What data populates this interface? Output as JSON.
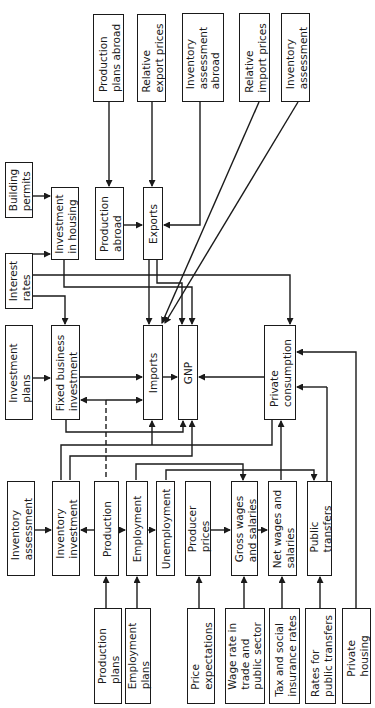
{
  "diagram": {
    "orientation": "rotated-90-ccw",
    "nodes": [
      {
        "id": "production_plans_abroad",
        "label": "Production\nplans abroad",
        "x": 93,
        "y": 14,
        "w": 31,
        "h": 88
      },
      {
        "id": "relative_export_prices",
        "label": "Relative\nexport prices",
        "x": 137,
        "y": 14,
        "w": 29,
        "h": 88
      },
      {
        "id": "inventory_assessment_abroad",
        "label": "Inventory\nassessment\nabroad",
        "x": 182,
        "y": 13,
        "w": 42,
        "h": 89
      },
      {
        "id": "relative_import_prices",
        "label": "Relative\nimport prices",
        "x": 239,
        "y": 13,
        "w": 31,
        "h": 89
      },
      {
        "id": "inventory_assessment_top",
        "label": "Inventory\nassessment",
        "x": 281,
        "y": 13,
        "w": 29,
        "h": 89
      },
      {
        "id": "building_permits",
        "label": "Building\npermits",
        "x": 5,
        "y": 162,
        "w": 28,
        "h": 56
      },
      {
        "id": "investment_in_housing",
        "label": "Investment\nin housing",
        "x": 51,
        "y": 187,
        "w": 28,
        "h": 73
      },
      {
        "id": "production_abroad",
        "label": "Production\nabroad",
        "x": 95,
        "y": 187,
        "w": 29,
        "h": 73
      },
      {
        "id": "exports",
        "label": "Exports",
        "x": 143,
        "y": 187,
        "w": 20,
        "h": 73
      },
      {
        "id": "interest_rates",
        "label": "Interest\nrates",
        "x": 5,
        "y": 253,
        "w": 28,
        "h": 56
      },
      {
        "id": "investment_plans",
        "label": "Investment\nplans",
        "x": 5,
        "y": 325,
        "w": 28,
        "h": 95
      },
      {
        "id": "fixed_business_investment",
        "label": "Fixed business\ninvestment",
        "x": 51,
        "y": 325,
        "w": 29,
        "h": 95
      },
      {
        "id": "imports",
        "label": "Imports",
        "x": 143,
        "y": 325,
        "w": 20,
        "h": 95
      },
      {
        "id": "gnp",
        "label": "GNP",
        "x": 178,
        "y": 325,
        "w": 20,
        "h": 95
      },
      {
        "id": "private_consumption",
        "label": "Private\nconsumption",
        "x": 264,
        "y": 325,
        "w": 32,
        "h": 95
      },
      {
        "id": "inventory_assessment",
        "label": "Inventory\nassessment",
        "x": 7,
        "y": 481,
        "w": 28,
        "h": 95
      },
      {
        "id": "inventory_investment",
        "label": "Inventory\ninvestment",
        "x": 52,
        "y": 481,
        "w": 28,
        "h": 95
      },
      {
        "id": "production",
        "label": "Production",
        "x": 94,
        "y": 481,
        "w": 25,
        "h": 95
      },
      {
        "id": "employment",
        "label": "Employment",
        "x": 126,
        "y": 481,
        "w": 22,
        "h": 95
      },
      {
        "id": "unemployment",
        "label": "Unemployment",
        "x": 156,
        "y": 481,
        "w": 19,
        "h": 95
      },
      {
        "id": "producer_prices",
        "label": "Producer\nprices",
        "x": 185,
        "y": 481,
        "w": 26,
        "h": 95
      },
      {
        "id": "gross_wages",
        "label": "Gross wages\nand salaries",
        "x": 231,
        "y": 481,
        "w": 27,
        "h": 95
      },
      {
        "id": "net_wages",
        "label": "Net wages and\nsalaries",
        "x": 268,
        "y": 481,
        "w": 29,
        "h": 95
      },
      {
        "id": "public_transfers",
        "label": "Public\ntransfers",
        "x": 307,
        "y": 481,
        "w": 25,
        "h": 95
      },
      {
        "id": "production_plans",
        "label": "Production\nplans",
        "x": 94,
        "y": 608,
        "w": 28,
        "h": 96
      },
      {
        "id": "employment_plans",
        "label": "Employment\nplans",
        "x": 125,
        "y": 608,
        "w": 26,
        "h": 96
      },
      {
        "id": "price_expectations",
        "label": "Price\nexpectations",
        "x": 187,
        "y": 608,
        "w": 28,
        "h": 96
      },
      {
        "id": "wage_rate",
        "label": "Wage rate in\ntrade and\npublic sector",
        "x": 225,
        "y": 608,
        "w": 40,
        "h": 96
      },
      {
        "id": "tax_social",
        "label": "Tax and social\ninsurance rates",
        "x": 269,
        "y": 608,
        "w": 31,
        "h": 96
      },
      {
        "id": "rates_public_transfers",
        "label": "Rates for\npublic transfers",
        "x": 305,
        "y": 608,
        "w": 31,
        "h": 96
      },
      {
        "id": "private_housing",
        "label": "Private\nhousing",
        "x": 342,
        "y": 608,
        "w": 29,
        "h": 96
      }
    ]
  }
}
